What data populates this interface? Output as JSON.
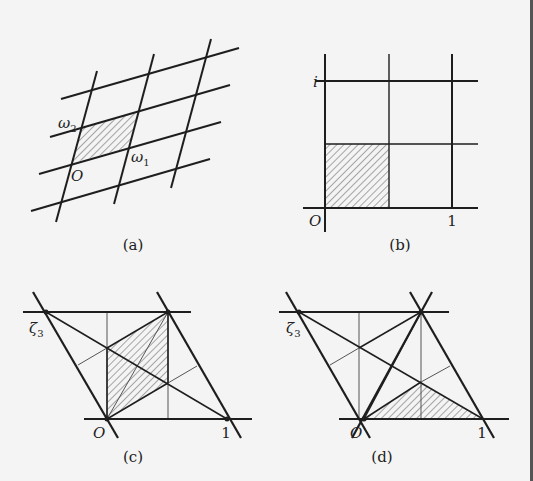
{
  "figure": {
    "panels": [
      {
        "id": "a",
        "caption": "(a)",
        "labels": {
          "origin": "O",
          "omega1": "ω",
          "omega1_sub": "1",
          "omega2": "ω",
          "omega2_sub": "2"
        },
        "description": "General lattice with period parallelogram spanned by ω1, ω2 shaded"
      },
      {
        "id": "b",
        "caption": "(b)",
        "labels": {
          "origin": "O",
          "one": "1",
          "i": "i"
        },
        "description": "Square lattice generated by 1 and i; fundamental region (quarter square) shaded"
      },
      {
        "id": "c",
        "caption": "(c)",
        "labels": {
          "origin": "O",
          "one": "1",
          "zeta": "ζ",
          "zeta_sub": "3"
        },
        "description": "Hexagonal lattice generated by 1 and ζ3; rhombic fundamental region shaded"
      },
      {
        "id": "d",
        "caption": "(d)",
        "labels": {
          "origin": "O",
          "one": "1",
          "zeta": "ζ",
          "zeta_sub": "3"
        },
        "description": "Hexagonal lattice with barycentric subdivision; triangular fundamental region shaded"
      }
    ],
    "colors": {
      "background": "#f4f4f4",
      "line": "#1e1e1e",
      "thin_line": "#555555",
      "hatch": "#555555"
    }
  }
}
